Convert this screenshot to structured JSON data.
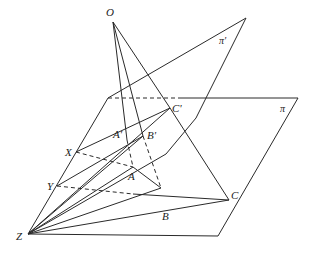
{
  "figure": {
    "labels": {
      "O": "O",
      "pi_prime": "π'",
      "pi": "π",
      "C_prime": "C'",
      "A_prime": "A'",
      "B_prime": "B'",
      "X": "X",
      "Y": "Y",
      "A": "A",
      "B": "B",
      "C": "C",
      "Z": "Z"
    },
    "points": {
      "O": [
        113,
        22
      ],
      "A": [
        133,
        167
      ],
      "B": [
        161,
        188
      ],
      "C": [
        229,
        200
      ],
      "A_prime": [
        127,
        140
      ],
      "B_prime": [
        143,
        136
      ],
      "C_prime": [
        170,
        108
      ],
      "X": [
        76,
        152
      ],
      "Y": [
        57,
        186
      ],
      "Z": [
        28,
        234
      ]
    },
    "colors": {
      "stroke": "#2a2a2a",
      "text": "#222222",
      "background": "#ffffff"
    }
  }
}
